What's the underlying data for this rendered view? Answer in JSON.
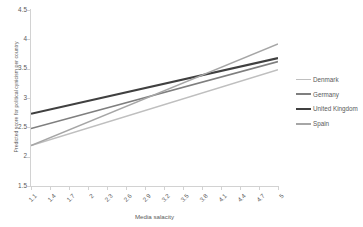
{
  "chart_data": {
    "type": "line",
    "title": "",
    "xlabel": "Media salacity",
    "ylabel": "Predicted score for political cynicism per country",
    "xlim": [
      1.1,
      5
    ],
    "ylim": [
      1.5,
      4.5
    ],
    "grid": false,
    "legend_position": "right",
    "x_tick_labels": [
      "1.1",
      "1.4",
      "1.7",
      "2",
      "2.3",
      "2.6",
      "2.9",
      "3.2",
      "3.5",
      "3.8",
      "4.1",
      "4.4",
      "4.7",
      "5"
    ],
    "x_tick_values": [
      1.1,
      1.4,
      1.7,
      2,
      2.3,
      2.6,
      2.9,
      3.2,
      3.5,
      3.8,
      4.1,
      4.4,
      4.7,
      5
    ],
    "y_tick_labels": [
      "1.5",
      "2",
      "2.5",
      "3",
      "3.5",
      "4",
      "4.5"
    ],
    "y_tick_values": [
      1.5,
      2,
      2.5,
      3,
      3.5,
      4,
      4.5
    ],
    "x": [
      1.1,
      5
    ],
    "series": [
      {
        "name": "Denmark",
        "values": [
          2.19,
          3.48
        ],
        "color": "#bfbfbf",
        "width": 1.5
      },
      {
        "name": "Germany",
        "values": [
          2.48,
          3.62
        ],
        "color": "#7f7f7f",
        "width": 1.6
      },
      {
        "name": "United Kingdom",
        "values": [
          2.73,
          3.68
        ],
        "color": "#404040",
        "width": 2.1
      },
      {
        "name": "Spain",
        "values": [
          2.19,
          3.92
        ],
        "color": "#a6a6a6",
        "width": 1.5
      }
    ]
  },
  "legend": {
    "items": [
      {
        "label": "Denmark"
      },
      {
        "label": "Germany"
      },
      {
        "label": "United Kingdom"
      },
      {
        "label": "Spain"
      }
    ]
  },
  "colors": {
    "axis": "#d2d2d2",
    "text": "#5a5a5a",
    "background": "#ffffff"
  }
}
